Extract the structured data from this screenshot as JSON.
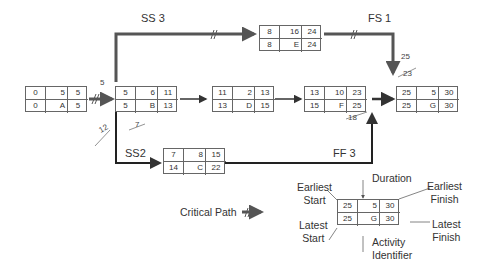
{
  "nodes": {
    "A": {
      "es": "0",
      "dur": "5",
      "ef": "5",
      "ls": "0",
      "id": "A",
      "lf": "5"
    },
    "B": {
      "es": "5",
      "dur": "6",
      "ef": "11",
      "ls": "5",
      "id": "B",
      "lf": "13"
    },
    "C": {
      "es": "7",
      "dur": "8",
      "ef": "15",
      "ls": "14",
      "id": "C",
      "lf": "22"
    },
    "D": {
      "es": "11",
      "dur": "2",
      "ef": "13",
      "ls": "13",
      "id": "D",
      "lf": "15"
    },
    "E": {
      "es": "8",
      "dur": "16",
      "ef": "24",
      "ls": "8",
      "id": "E",
      "lf": "24"
    },
    "F": {
      "es": "13",
      "dur": "10",
      "ef": "23",
      "ls": "15",
      "id": "F",
      "lf": "25"
    },
    "G": {
      "es": "25",
      "dur": "5",
      "ef": "30",
      "ls": "25",
      "id": "G",
      "lf": "30"
    },
    "legend": {
      "es": "25",
      "dur": "5",
      "ef": "30",
      "ls": "25",
      "id": "G",
      "lf": "30"
    }
  },
  "relationships": {
    "ss3": "SS 3",
    "fs1": "FS 1",
    "ss2": "SS2",
    "ff3": "FF 3"
  },
  "annotations": {
    "b_start": "5",
    "b_struck_left": "12",
    "b_struck_right": "7",
    "g_top": "25",
    "g_struck": "23",
    "f_struck": "18"
  },
  "legend": {
    "critical_path": "Critical Path",
    "earliest_start_1": "Earliest",
    "earliest_start_2": "Start",
    "duration": "Duration",
    "earliest_finish_1": "Earliest",
    "earliest_finish_2": "Finish",
    "latest_start_1": "Latest",
    "latest_start_2": "Start",
    "latest_finish_1": "Latest",
    "latest_finish_2": "Finish",
    "activity_id_1": "Activity",
    "activity_id_2": "Identifier"
  }
}
